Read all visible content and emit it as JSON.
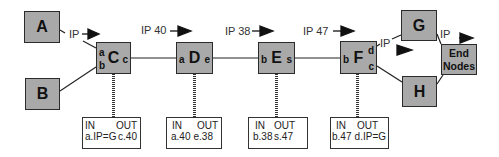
{
  "diagram": {
    "nodes": {
      "A": {
        "label": "A"
      },
      "B": {
        "label": "B"
      },
      "C": {
        "label": "C",
        "ports": {
          "a": "a",
          "b": "b",
          "c": "c"
        }
      },
      "D": {
        "label": "D",
        "ports": {
          "a": "a",
          "e": "e"
        }
      },
      "E": {
        "label": "E",
        "ports": {
          "b": "b",
          "s": "s"
        }
      },
      "F": {
        "label": "F",
        "ports": {
          "b": "b",
          "d": "d",
          "c": "c"
        }
      },
      "G": {
        "label": "G"
      },
      "H": {
        "label": "H"
      },
      "end_nodes": {
        "label_line1": "End",
        "label_line2": "Nodes"
      }
    },
    "edge_labels": {
      "a_to_c": "IP",
      "c_to_d": "IP 40",
      "d_to_e": "IP 38",
      "e_to_f": "IP 47",
      "f_to_g": "IP",
      "g_to_end": "IP"
    },
    "tables": [
      {
        "node": "C",
        "in_header": "IN",
        "out_header": "OUT",
        "in_value": "a.IP=G",
        "out_value": "c.40"
      },
      {
        "node": "D",
        "in_header": "IN",
        "out_header": "OUT",
        "in_value": "a.40",
        "out_value": "e.38"
      },
      {
        "node": "E",
        "in_header": "IN",
        "out_header": "OUT",
        "in_value": "b.38",
        "out_value": "s.47"
      },
      {
        "node": "F",
        "in_header": "IN",
        "out_header": "OUT",
        "in_value": "b.47",
        "out_value": "d.IP=G"
      }
    ],
    "colors": {
      "node_fill": "#a9a9a9",
      "stroke": "#2b2b2b",
      "arrow": "#111111"
    }
  }
}
